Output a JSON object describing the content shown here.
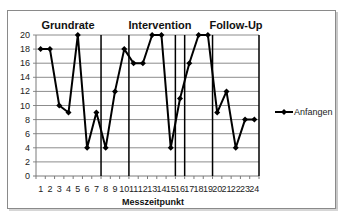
{
  "chart_data": {
    "type": "line",
    "title": "",
    "xlabel": "Messzeitpunkt",
    "ylabel": "",
    "ylim": [
      0,
      20
    ],
    "yticks": [
      0,
      2,
      4,
      6,
      8,
      10,
      12,
      14,
      16,
      18,
      20
    ],
    "grid": true,
    "legend_position": "right",
    "categories": [
      "1",
      "2",
      "3",
      "4",
      "5",
      "6",
      "7",
      "8",
      "9",
      "10",
      "11",
      "12",
      "13",
      "14",
      "15",
      "16",
      "17",
      "18",
      "19",
      "20",
      "21",
      "22",
      "23",
      "24"
    ],
    "series": [
      {
        "name": "Anfangen",
        "values": [
          18,
          18,
          10,
          9,
          20,
          4,
          9,
          4,
          12,
          18,
          16,
          16,
          20,
          20,
          4,
          11,
          16,
          20,
          20,
          9,
          12,
          4,
          8,
          8
        ],
        "color": "#000000",
        "marker": "diamond"
      }
    ],
    "phase_dividers_after_category": [
      7,
      10,
      15,
      16,
      19
    ],
    "annotations": [
      {
        "text": "Grundrate",
        "position": "above categories 1-7"
      },
      {
        "text": "Intervention",
        "position": "above categories 8-15"
      },
      {
        "text": "Follow-Up",
        "position": "above categories 20-24"
      }
    ]
  },
  "labels": {
    "phase_baseline": "Grundrate",
    "phase_intervention": "Intervention",
    "phase_followup": "Follow-Up",
    "x_axis_title": "Messzeitpunkt",
    "legend_series": "Anfangen"
  }
}
